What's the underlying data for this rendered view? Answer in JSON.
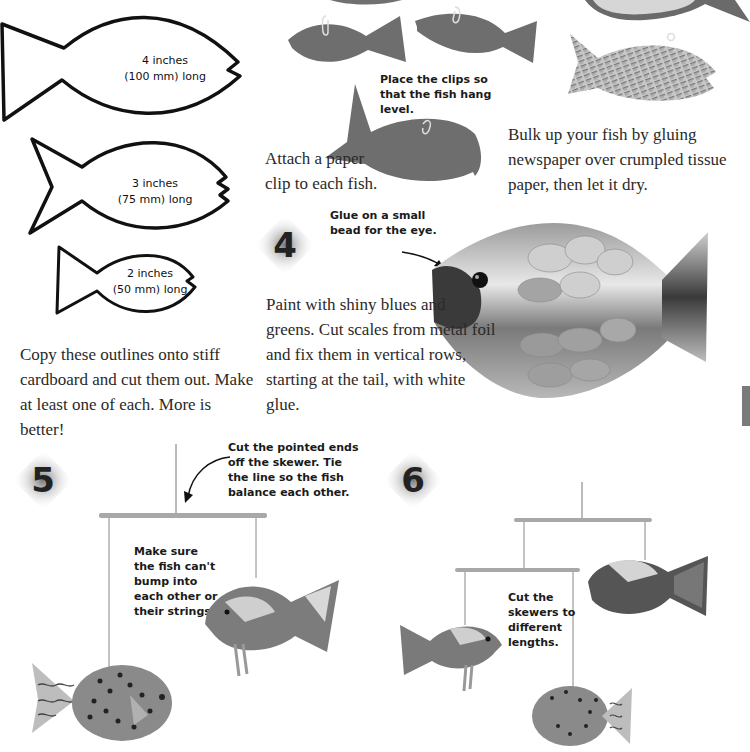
{
  "page": {
    "background": "#ffffff",
    "side_tab_color": "#7a7a7a"
  },
  "outlines": {
    "large": {
      "line1": "4 inches",
      "line2": "(100 mm) long"
    },
    "medium": {
      "line1": "3 inches",
      "line2": "(75 mm) long"
    },
    "small": {
      "line1": "2 inches",
      "line2": "(50 mm) long"
    },
    "instruction": "Copy these outlines onto stiff cardboard and cut them out. Make at least one of each. More is better!"
  },
  "step2": {
    "caption": "Place the clips so that the fish hang level.",
    "instruction": "Attach a paper clip to each fish."
  },
  "step3": {
    "instruction": "Bulk up your fish by gluing newspaper over crumpled tissue paper, then let it dry."
  },
  "step4": {
    "number": "4",
    "caption": "Glue on a small bead for the eye.",
    "instruction": "Paint with shiny blues and greens. Cut scales from metal foil and fix them in vertical rows, starting at the tail, with white glue."
  },
  "step5": {
    "number": "5",
    "caption_top": "Cut the pointed ends off the skewer. Tie the line so the fish balance each other.",
    "caption_middle": "Make sure the fish can't bump into each other or their strings."
  },
  "step6": {
    "number": "6",
    "caption": "Cut the skewers to different lengths."
  }
}
